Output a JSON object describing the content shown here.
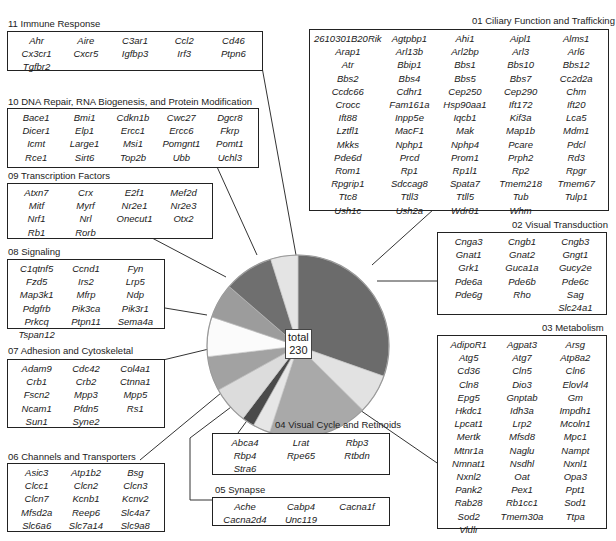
{
  "chart_data": {
    "type": "pie",
    "title": "",
    "center_label": {
      "line1": "total",
      "line2": "230"
    },
    "total": 230,
    "start_angle": "12 o'clock, clockwise",
    "categories": [
      "01 Ciliary Function and Trafficking",
      "02 Visual Transduction",
      "03 Metabolism",
      "04 Visual Cycle and Retinoids",
      "05 Synapse",
      "06 Channels and Transporters",
      "07 Adhesion and Cytoskeletal",
      "08 Signaling",
      "09 Transcription Factors",
      "10 DNA Repair, RNA Biogenesis, and Protein Modification",
      "11 Immune Response"
    ],
    "values": [
      69,
      16,
      40,
      7,
      5,
      15,
      14,
      16,
      14,
      20,
      11
    ],
    "colors": [
      "#6b6b6b",
      "#e2e2e2",
      "#a9a9a9",
      "#e6e6e6",
      "#4a4a4a",
      "#dcdcdc",
      "#a2a2a2",
      "#fbfbfb",
      "#9c9c9c",
      "#6f6f6f",
      "#e4e4e4"
    ]
  },
  "groups": {
    "g01": {
      "title": "01 Ciliary Function and Trafficking",
      "genes": [
        "2610301B20Rik",
        "Agtpbp1",
        "Ahi1",
        "Aipl1",
        "Alms1",
        "Arap1",
        "Arl13b",
        "Arl2bp",
        "Arl3",
        "Arl6",
        "Atr",
        "Bbip1",
        "Bbs1",
        "Bbs10",
        "Bbs12",
        "Bbs2",
        "Bbs4",
        "Bbs5",
        "Bbs7",
        "Cc2d2a",
        "Ccdc66",
        "Cdhr1",
        "Cep250",
        "Cep290",
        "Chm",
        "Crocc",
        "Fam161a",
        "Hsp90aa1",
        "Ift172",
        "Ift20",
        "Ift88",
        "Inpp5e",
        "Iqcb1",
        "Kif3a",
        "Lca5",
        "Lztfl1",
        "MacF1",
        "Mak",
        "Map1b",
        "Mdm1",
        "Mkks",
        "Nphp1",
        "Nphp4",
        "Pcare",
        "Pdcl",
        "Pde6d",
        "Prcd",
        "Prom1",
        "Prph2",
        "Rd3",
        "Rom1",
        "Rp1",
        "Rp1l1",
        "Rp2",
        "Rpgr",
        "Rpgrip1",
        "Sdccag8",
        "Spata7",
        "Tmem218",
        "Tmem67",
        "Ttc8",
        "Ttll3",
        "Ttll5",
        "Tub",
        "Tulp1",
        "Ush1c",
        "Ush2a",
        "Wdr81",
        "Whm"
      ]
    },
    "g02": {
      "title": "02 Visual Transduction",
      "genes": [
        "Cnga3",
        "Cngb1",
        "Cngb3",
        "Gnat1",
        "Gnat2",
        "Gngt1",
        "Grk1",
        "Guca1a",
        "Gucy2e",
        "Pde6a",
        "Pde6b",
        "Pde6c",
        "Pde6g",
        "Rho",
        "Sag",
        "",
        "",
        "Slc24a1"
      ]
    },
    "g03": {
      "title": "03 Metabolism",
      "genes": [
        "AdipoR1",
        "Agpat3",
        "Arsg",
        "Atg5",
        "Atg7",
        "Atp8a2",
        "Cd36",
        "Cln5",
        "Cln6",
        "Cln8",
        "Dio3",
        "Elovl4",
        "Epg5",
        "Gnptab",
        "Gm",
        "Hkdc1",
        "Idh3a",
        "Impdh1",
        "Lpcat1",
        "Lrp2",
        "Mcoln1",
        "Mertk",
        "Mfsd8",
        "Mpc1",
        "Mtnr1a",
        "Naglu",
        "Nampt",
        "Nmnat1",
        "Nsdhl",
        "Nxnl1",
        "Nxnl2",
        "Oat",
        "Opa3",
        "Pank2",
        "Pex1",
        "Ppt1",
        "Rab28",
        "Rb1cc1",
        "Sod1",
        "Sod2",
        "Tmem30a",
        "Ttpa",
        "Vldlr"
      ]
    },
    "g04": {
      "title": "04 Visual Cycle and Retinoids",
      "genes": [
        "Abca4",
        "Lrat",
        "Rbp3",
        "Rbp4",
        "Rpe65",
        "Rtbdn",
        "Stra6"
      ]
    },
    "g05": {
      "title": "05 Synapse",
      "genes": [
        "Ache",
        "Cabp4",
        "Cacna1f",
        "Cacna2d4",
        "Unc119"
      ]
    },
    "g06": {
      "title": "06 Channels and Transporters",
      "genes": [
        "Asic3",
        "Atp1b2",
        "Bsg",
        "Clcc1",
        "Clcn2",
        "Clcn3",
        "Clcn7",
        "Kcnb1",
        "Kcnv2",
        "Mfsd2a",
        "Reep6",
        "Slc4a7",
        "Slc6a6",
        "Slc7a14",
        "Slc9a8"
      ]
    },
    "g07": {
      "title": "07 Adhesion and Cytoskeletal",
      "genes": [
        "Adam9",
        "Cdc42",
        "Col4a1",
        "Crb1",
        "Crb2",
        "Ctnna1",
        "Fscn2",
        "Mpp3",
        "Mpp5",
        "Ncam1",
        "Pfdn5",
        "Rs1",
        "Sun1",
        "Syne2"
      ]
    },
    "g08": {
      "title": "08 Signaling",
      "genes": [
        "C1qtnf5",
        "Ccnd1",
        "Fyn",
        "Fzd5",
        "Irs2",
        "Lrp5",
        "Map3k1",
        "Mfrp",
        "Ndp",
        "Pdgfrb",
        "Pik3ca",
        "Pik3r1",
        "Prkcq",
        "Ptpn11",
        "Sema4a",
        "Tspan12"
      ]
    },
    "g09": {
      "title": "09 Transcription Factors",
      "genes": [
        "Atxn7",
        "Crx",
        "E2f1",
        "Mef2d",
        "Mitf",
        "Myrf",
        "Nr2e1",
        "Nr2e3",
        "Nrf1",
        "Nrl",
        "Onecut1",
        "Otx2",
        "Rb1",
        "Rorb"
      ]
    },
    "g10": {
      "title": "10 DNA Repair, RNA Biogenesis, and Protein Modification",
      "genes": [
        "Bace1",
        "Bmi1",
        "Cdkn1b",
        "Cwc27",
        "Dgcr8",
        "Dicer1",
        "Elp1",
        "Ercc1",
        "Ercc6",
        "Fkrp",
        "Icmt",
        "Large1",
        "Msi1",
        "Pomgnt1",
        "Pomt1",
        "Rce1",
        "Sirt6",
        "Top2b",
        "Ubb",
        "Uchl3"
      ]
    },
    "g11": {
      "title": "11 Immune Response",
      "genes": [
        "Ahr",
        "Aire",
        "C3ar1",
        "Ccl2",
        "Cd46",
        "Cx3cr1",
        "Cxcr5",
        "Igfbp3",
        "Irf3",
        "Ptpn6",
        "Tgfbr2"
      ]
    }
  }
}
